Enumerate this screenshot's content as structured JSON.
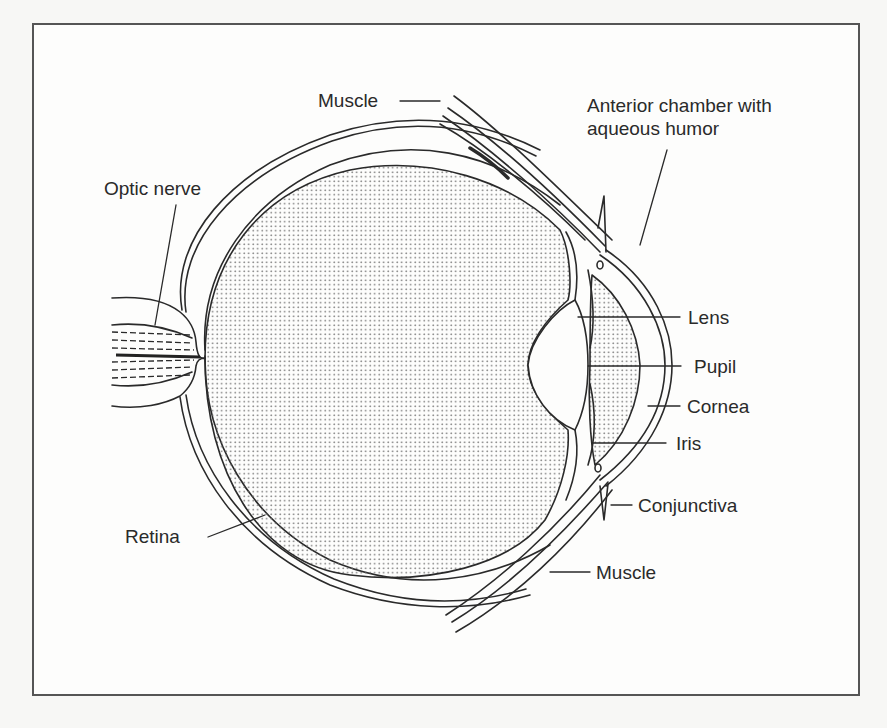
{
  "diagram": {
    "labels": {
      "muscle_top": "Muscle",
      "anterior_chamber_line1": "Anterior chamber with",
      "anterior_chamber_line2": "aqueous humor",
      "optic_nerve": "Optic nerve",
      "lens": "Lens",
      "pupil": "Pupil",
      "cornea": "Cornea",
      "iris": "Iris",
      "conjunctiva": "Conjunctiva",
      "retina": "Retina",
      "muscle_bottom": "Muscle"
    },
    "colors": {
      "line": "#2a2a2a",
      "stipple": "#6a6a6a",
      "frame": "#555555",
      "background": "#fdfdfc"
    }
  }
}
